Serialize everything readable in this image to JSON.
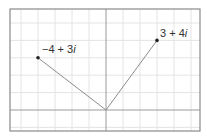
{
  "diagram": {
    "type": "complex-plane",
    "unit_px_x": 17,
    "unit_px_y": 17.4,
    "origin_px": [
      106,
      110
    ],
    "frame_px": {
      "left": 10,
      "top": 9,
      "right": 200,
      "bottom": 131
    },
    "grid_x": [
      -5,
      -4,
      -3,
      -2,
      -1,
      1,
      2,
      3,
      4,
      5
    ],
    "grid_y": [
      -1,
      1,
      2,
      3,
      4,
      5
    ],
    "colors": {
      "grid": "#e4e4e4",
      "axis": "#9a9a9a",
      "frame": "#8a8a8a",
      "vector": "#8c8c8c",
      "point": "#222222",
      "text": "#333333"
    },
    "points": [
      {
        "re": 3,
        "im": 4,
        "label_real": "3 + 4",
        "label_imag": "i"
      },
      {
        "re": -4,
        "im": 3,
        "label_real": "−4 + 3",
        "label_imag": "i"
      }
    ]
  }
}
